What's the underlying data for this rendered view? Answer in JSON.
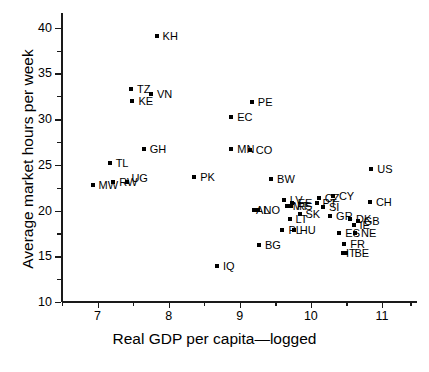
{
  "chart_data": {
    "type": "scatter",
    "title": "",
    "xlabel": "Real GDP per capita—logged",
    "ylabel": "Average market hours per week",
    "xlim": [
      6.5,
      11.45
    ],
    "ylim": [
      10,
      41.5
    ],
    "xticks": [
      7,
      8,
      9,
      10,
      11
    ],
    "xticklabels": [
      "7",
      "8",
      "9",
      "10",
      "11"
    ],
    "xminorticks": [
      6.5,
      7.5,
      8.5,
      9.5,
      10.5,
      11.4
    ],
    "yticks": [
      10,
      15,
      20,
      25,
      30,
      35,
      40
    ],
    "yticklabels": [
      "10",
      "15",
      "20",
      "25",
      "30",
      "35",
      "40"
    ],
    "yminorticks": [
      12.5,
      17.5,
      22.5,
      27.5,
      32.5,
      37.5
    ],
    "grid": false,
    "legend": null,
    "marker": "square",
    "marker_color": "#000000",
    "points": [
      {
        "label": "KH",
        "x": 7.83,
        "y": 39.1,
        "lx": 6,
        "ly": 0
      },
      {
        "label": "TZ",
        "x": 7.47,
        "y": 33.3,
        "lx": 6,
        "ly": 0
      },
      {
        "label": "VN",
        "x": 7.75,
        "y": 32.7,
        "lx": 6,
        "ly": 0
      },
      {
        "label": "KE",
        "x": 7.49,
        "y": 32.0,
        "lx": 6,
        "ly": 0
      },
      {
        "label": "PE",
        "x": 9.17,
        "y": 31.9,
        "lx": 6,
        "ly": 0
      },
      {
        "label": "EC",
        "x": 8.88,
        "y": 30.2,
        "lx": 6,
        "ly": 0
      },
      {
        "label": "GH",
        "x": 7.65,
        "y": 26.7,
        "lx": 6,
        "ly": 0
      },
      {
        "label": "MN",
        "x": 8.88,
        "y": 26.7,
        "lx": 6,
        "ly": 0
      },
      {
        "label": "CO",
        "x": 9.14,
        "y": 26.6,
        "lx": 6,
        "ly": 0
      },
      {
        "label": "TL",
        "x": 7.17,
        "y": 25.2,
        "lx": 6,
        "ly": 0
      },
      {
        "label": "US",
        "x": 10.85,
        "y": 24.5,
        "lx": 6,
        "ly": 0
      },
      {
        "label": "PK",
        "x": 8.36,
        "y": 23.7,
        "lx": 6,
        "ly": 0
      },
      {
        "label": "BW",
        "x": 9.44,
        "y": 23.5,
        "lx": 6,
        "ly": 0
      },
      {
        "label": "RW",
        "x": 7.22,
        "y": 23.1,
        "lx": 6,
        "ly": 0
      },
      {
        "label": "UG",
        "x": 7.42,
        "y": 23.1,
        "lx": 4,
        "ly": -4
      },
      {
        "label": "MW",
        "x": 6.93,
        "y": 22.8,
        "lx": 6,
        "ly": 0
      },
      {
        "label": "CY",
        "x": 10.31,
        "y": 21.6,
        "lx": 6,
        "ly": 0
      },
      {
        "label": "CZ",
        "x": 10.11,
        "y": 21.4,
        "lx": 6,
        "ly": 0
      },
      {
        "label": "LV",
        "x": 9.62,
        "y": 21.2,
        "lx": 6,
        "ly": 0
      },
      {
        "label": "CH",
        "x": 10.83,
        "y": 20.9,
        "lx": 6,
        "ly": 0
      },
      {
        "label": "EE",
        "x": 9.73,
        "y": 20.8,
        "lx": 6,
        "ly": 0
      },
      {
        "label": "PT",
        "x": 10.08,
        "y": 20.8,
        "lx": 6,
        "ly": 0
      },
      {
        "label": "MT",
        "x": 9.66,
        "y": 20.5,
        "lx": 6,
        "ly": 0
      },
      {
        "label": "RS",
        "x": 9.72,
        "y": 20.5,
        "lx": 6,
        "ly": 0
      },
      {
        "label": "SI",
        "x": 10.17,
        "y": 20.4,
        "lx": 6,
        "ly": 0
      },
      {
        "label": "AL",
        "x": 9.2,
        "y": 20.1,
        "lx": 2,
        "ly": 0
      },
      {
        "label": "NO",
        "x": 9.25,
        "y": 20.1,
        "lx": 6,
        "ly": 0
      },
      {
        "label": "SK",
        "x": 9.84,
        "y": 19.6,
        "lx": 6,
        "ly": 0
      },
      {
        "label": "GR",
        "x": 10.27,
        "y": 19.4,
        "lx": 6,
        "ly": 0
      },
      {
        "label": "LT",
        "x": 9.7,
        "y": 19.1,
        "lx": 6,
        "ly": 0
      },
      {
        "label": "DK",
        "x": 10.55,
        "y": 19.1,
        "lx": 6,
        "ly": 0
      },
      {
        "label": "GB",
        "x": 10.66,
        "y": 18.9,
        "lx": 6,
        "ly": 0
      },
      {
        "label": "IE",
        "x": 10.6,
        "y": 18.4,
        "lx": 6,
        "ly": 0
      },
      {
        "label": "PL",
        "x": 9.6,
        "y": 17.9,
        "lx": 6,
        "ly": 0
      },
      {
        "label": "HU",
        "x": 9.76,
        "y": 17.9,
        "lx": 6,
        "ly": 0
      },
      {
        "label": "ES",
        "x": 10.4,
        "y": 17.6,
        "lx": 6,
        "ly": 0
      },
      {
        "label": "NE",
        "x": 10.62,
        "y": 17.6,
        "lx": 6,
        "ly": 0
      },
      {
        "label": "FR",
        "x": 10.47,
        "y": 16.3,
        "lx": 6,
        "ly": 0
      },
      {
        "label": "BG",
        "x": 9.27,
        "y": 16.2,
        "lx": 6,
        "ly": 0
      },
      {
        "label": "IT",
        "x": 10.45,
        "y": 15.4,
        "lx": 3,
        "ly": 0
      },
      {
        "label": "BE",
        "x": 10.5,
        "y": 15.4,
        "lx": 8,
        "ly": 0
      },
      {
        "label": "IQ",
        "x": 8.68,
        "y": 13.9,
        "lx": 6,
        "ly": 0
      }
    ]
  }
}
